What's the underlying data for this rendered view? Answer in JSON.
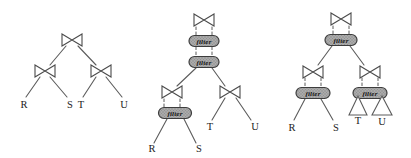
{
  "figure": {
    "bg_color": "#ffffff",
    "line_color": "#5c5c5c",
    "join_fill": "#ffffff",
    "join_stroke": "#4a4a4a",
    "filter_fill": "#ababab",
    "filter_dot_color": "#8a8a8a",
    "filter_stroke": "#3d3d3d",
    "filter_text_color": "#141414",
    "leaf_text_color": "#1c1c1c",
    "triangle_fill": "#ffffff",
    "join_half_width": 10,
    "join_half_height": 6,
    "trees": [
      {
        "name": "plan-1",
        "joins": [
          {
            "cx": 72,
            "cy": 40
          },
          {
            "cx": 45,
            "cy": 71
          },
          {
            "cx": 101,
            "cy": 71
          }
        ],
        "filters": [],
        "triangles": [],
        "leaves": [
          {
            "label": "R",
            "x": 24,
            "cy": 104
          },
          {
            "label": "S",
            "x": 70,
            "cy": 104
          },
          {
            "label": "T",
            "x": 81,
            "cy": 104
          },
          {
            "label": "U",
            "x": 124,
            "cy": 104
          }
        ],
        "solid_edges": [
          [
            66,
            46,
            50,
            65
          ],
          [
            78,
            46,
            96,
            65
          ],
          [
            40,
            77,
            26,
            97
          ],
          [
            50,
            77,
            67,
            97
          ],
          [
            96,
            77,
            83,
            97
          ],
          [
            106,
            77,
            122,
            97
          ]
        ],
        "dashed_edges": []
      },
      {
        "name": "plan-2",
        "joins": [
          {
            "cx": 204,
            "cy": 20
          },
          {
            "cx": 172,
            "cy": 92
          },
          {
            "cx": 230,
            "cy": 92
          }
        ],
        "filters": [
          {
            "label": "filter",
            "cx": 204,
            "cy": 41,
            "w": 30,
            "h": 11
          },
          {
            "label": "filter",
            "cx": 204,
            "cy": 62,
            "w": 30,
            "h": 11
          },
          {
            "label": "filter",
            "cx": 175,
            "cy": 113,
            "w": 33,
            "h": 11
          }
        ],
        "triangles": [],
        "leaves": [
          {
            "label": "R",
            "x": 152,
            "cy": 148
          },
          {
            "label": "S",
            "x": 199,
            "cy": 148
          },
          {
            "label": "T",
            "x": 210,
            "cy": 126
          },
          {
            "label": "U",
            "x": 255,
            "cy": 126
          }
        ],
        "solid_edges": [
          [
            196,
            68,
            177,
            86
          ],
          [
            212,
            68,
            225,
            86
          ],
          [
            167,
            119,
            154,
            143
          ],
          [
            184,
            119,
            196,
            143
          ],
          [
            225,
            98,
            212,
            120
          ],
          [
            236,
            98,
            251,
            120
          ]
        ],
        "dashed_edges": [
          [
            196,
            27,
            196,
            35
          ],
          [
            212,
            27,
            212,
            35
          ],
          [
            196,
            47,
            196,
            56
          ],
          [
            212,
            47,
            212,
            56
          ],
          [
            164,
            99,
            164,
            107
          ],
          [
            180,
            99,
            180,
            107
          ]
        ]
      },
      {
        "name": "plan-3",
        "joins": [
          {
            "cx": 341,
            "cy": 19
          },
          {
            "cx": 313,
            "cy": 72
          },
          {
            "cx": 370,
            "cy": 72
          }
        ],
        "filters": [
          {
            "label": "filter",
            "cx": 341,
            "cy": 40,
            "w": 32,
            "h": 11
          },
          {
            "label": "filter",
            "cx": 313,
            "cy": 93,
            "w": 34,
            "h": 11
          },
          {
            "label": "filter",
            "cx": 370,
            "cy": 93,
            "w": 34,
            "h": 11
          }
        ],
        "triangles": [
          {
            "label": "T",
            "apex_x": 358,
            "apex_y": 96,
            "base_y": 115,
            "half_w": 9,
            "label_cy": 120
          },
          {
            "label": "U",
            "apex_x": 382,
            "apex_y": 96,
            "base_y": 115,
            "half_w": 10,
            "label_cy": 121
          }
        ],
        "leaves": [
          {
            "label": "R",
            "x": 292,
            "cy": 127
          },
          {
            "label": "S",
            "x": 336,
            "cy": 127
          }
        ],
        "solid_edges": [
          [
            332,
            46,
            318,
            65
          ],
          [
            350,
            46,
            364,
            65
          ],
          [
            305,
            99,
            294,
            120
          ],
          [
            321,
            99,
            333,
            120
          ]
        ],
        "dashed_edges": [
          [
            333,
            26,
            333,
            34
          ],
          [
            349,
            26,
            349,
            34
          ],
          [
            305,
            78,
            305,
            87
          ],
          [
            321,
            78,
            321,
            87
          ],
          [
            362,
            78,
            362,
            87
          ],
          [
            378,
            78,
            378,
            87
          ]
        ]
      }
    ]
  }
}
